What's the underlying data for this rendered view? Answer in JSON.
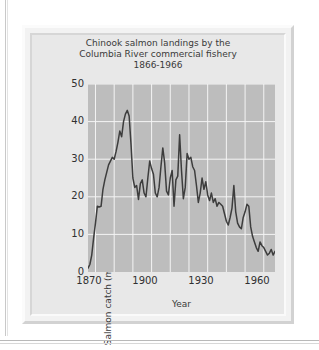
{
  "figure": {
    "title_line1": "Chinook salmon landings by the",
    "title_line2": "Columbia River commercial fishery",
    "title_line3": "1866-1966"
  },
  "axes": {
    "y_ticks": [
      "50",
      "40",
      "30",
      "20",
      "10",
      "0"
    ],
    "x_ticks": [
      "1870",
      "1900",
      "1930",
      "1960"
    ],
    "x_title": "Year",
    "y_title": "Salmon catch (millioms of pounds)"
  },
  "colors": {
    "page_background": "#ffffff",
    "frame": "#f2f2f2",
    "card": "#e8e8e8",
    "plot_background": "#bdbdbd",
    "gridline": "#f4f4f4",
    "series_line": "#3d3d3d",
    "text": "#3a3a3a"
  },
  "chart_data": {
    "type": "line",
    "title": "Chinook salmon landings by the Columbia River commercial fishery 1866-1966",
    "xlabel": "Year",
    "ylabel": "Salmon catch (millioms of pounds)",
    "xlim": [
      1866,
      1966
    ],
    "ylim": [
      0,
      50
    ],
    "y_tick_values": [
      0,
      10,
      20,
      30,
      40,
      50
    ],
    "x_tick_values": [
      1870,
      1900,
      1930,
      1960
    ],
    "x_gridline_values": [
      1870,
      1880,
      1890,
      1900,
      1910,
      1920,
      1930,
      1940,
      1950,
      1960
    ],
    "grid": true,
    "legend": "none",
    "series": [
      {
        "name": "Chinook salmon landings",
        "x": [
          1866,
          1867,
          1868,
          1869,
          1870,
          1871,
          1872,
          1873,
          1874,
          1875,
          1876,
          1877,
          1878,
          1879,
          1880,
          1881,
          1882,
          1883,
          1884,
          1885,
          1886,
          1887,
          1888,
          1889,
          1890,
          1891,
          1892,
          1893,
          1894,
          1895,
          1896,
          1897,
          1898,
          1899,
          1900,
          1901,
          1902,
          1903,
          1904,
          1905,
          1906,
          1907,
          1908,
          1909,
          1910,
          1911,
          1912,
          1913,
          1914,
          1915,
          1916,
          1917,
          1918,
          1919,
          1920,
          1921,
          1922,
          1923,
          1924,
          1925,
          1926,
          1927,
          1928,
          1929,
          1930,
          1931,
          1932,
          1933,
          1934,
          1935,
          1936,
          1937,
          1938,
          1939,
          1940,
          1941,
          1942,
          1943,
          1944,
          1945,
          1946,
          1947,
          1948,
          1949,
          1950,
          1951,
          1952,
          1953,
          1954,
          1955,
          1956,
          1957,
          1958,
          1959,
          1960,
          1961,
          1962,
          1963,
          1964,
          1965,
          1966
        ],
        "values": [
          1.0,
          2.0,
          4.5,
          9.0,
          13.0,
          17.5,
          17.3,
          17.5,
          22.0,
          24.5,
          26.5,
          28.5,
          29.5,
          30.5,
          30.0,
          32.0,
          34.5,
          37.5,
          36.0,
          40.0,
          42.0,
          43.0,
          41.5,
          34.0,
          25.0,
          22.5,
          23.0,
          19.3,
          23.5,
          24.5,
          21.0,
          20.0,
          25.0,
          29.5,
          27.5,
          26.0,
          21.0,
          20.0,
          22.5,
          28.0,
          33.0,
          29.0,
          21.5,
          20.5,
          25.0,
          27.0,
          17.5,
          24.5,
          25.5,
          36.5,
          27.0,
          19.5,
          22.5,
          31.5,
          30.0,
          30.5,
          28.0,
          27.0,
          23.0,
          18.5,
          21.0,
          25.0,
          22.0,
          24.0,
          20.5,
          19.0,
          21.0,
          18.5,
          19.5,
          17.5,
          18.5,
          18.0,
          17.5,
          15.5,
          13.5,
          12.5,
          14.5,
          17.0,
          23.0,
          16.0,
          13.0,
          12.0,
          11.5,
          14.5,
          16.0,
          18.0,
          17.5,
          12.0,
          9.5,
          8.0,
          6.5,
          5.5,
          8.0,
          7.0,
          6.5,
          5.5,
          4.5,
          5.0,
          6.0,
          4.5,
          5.5
        ]
      }
    ]
  }
}
